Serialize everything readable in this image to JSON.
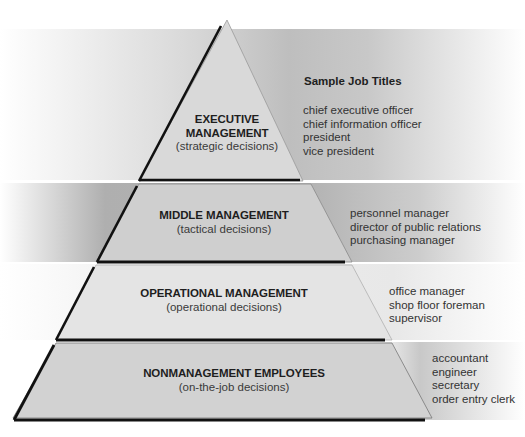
{
  "diagram": {
    "type": "pyramid",
    "job_titles_heading": "Sample Job Titles",
    "tiers": [
      {
        "title_lines": [
          "EXECUTIVE",
          "MANAGEMENT"
        ],
        "subtitle": "(strategic decisions)",
        "fill": "#d9d9d9",
        "job_titles": [
          "chief executive officer",
          "chief information officer",
          "president",
          "vice president"
        ]
      },
      {
        "title_lines": [
          "MIDDLE MANAGEMENT"
        ],
        "subtitle": "(tactical decisions)",
        "fill": "#cfcfcf",
        "job_titles": [
          "personnel manager",
          "director of public relations",
          "purchasing manager"
        ]
      },
      {
        "title_lines": [
          "OPERATIONAL MANAGEMENT"
        ],
        "subtitle": "(operational decisions)",
        "fill": "#e4e4e4",
        "job_titles": [
          "office manager",
          "shop floor foreman",
          "supervisor"
        ]
      },
      {
        "title_lines": [
          "NONMANAGEMENT EMPLOYEES"
        ],
        "subtitle": "(on-the-job decisions)",
        "fill": "#d2d2d2",
        "job_titles": [
          "accountant",
          "engineer",
          "secretary",
          "order entry clerk"
        ]
      }
    ]
  }
}
